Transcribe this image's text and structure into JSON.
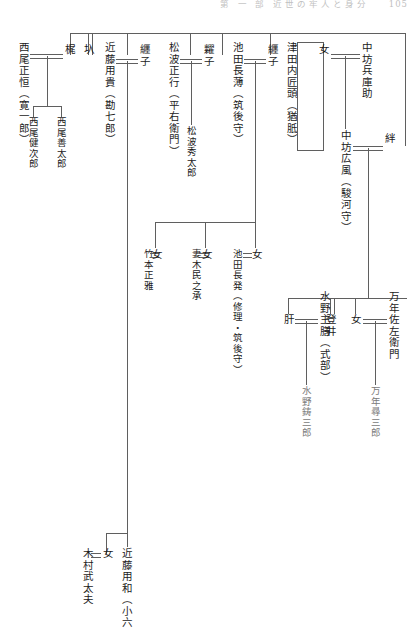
{
  "header": {
    "running_head": "第 一 部  近世の牢人と身分",
    "page_number": "105"
  },
  "chart": {
    "kind": "genealogy-tree",
    "orientation": "vertical-japanese",
    "people": {
      "nishio_masatsune": "西尾正恒（寛一郎）",
      "kaji": "梶",
      "iri": "圦",
      "nishio_kenjiro": "西尾健次郎",
      "nishio_zentaro": "西尾善太郎",
      "kondo_mochitaka": "近藤用貴（勘七郎）",
      "ito_ko_1": "纒子",
      "matsunami_masayuki": "松波正行（平右衛門）",
      "ito_ko_2": "糶子",
      "matsunami_hidetaro": "松波秀太郎",
      "ikeda_nagausu": "池田長薄（筑後守）",
      "ito_ko_3": "纒子",
      "tsuda_takumi_no_kami": "津田内匠頭（猶胝）",
      "onna_a": "女",
      "nakabo_hyogonosuke": "中坊兵庫助",
      "nakabo_hirokaze": "中坊広風（駿河守）",
      "kizuna": "絆",
      "takemoto_masamasa": "竹本正雅",
      "onna_b": "女",
      "tsumaki_tamiosuke": "妻木民之承",
      "onna_c": "女",
      "ikeda_nagaoki": "池田長発（修理・筑後守）",
      "onna_d": "女",
      "kimo": "肝",
      "mizuno_shuzen": "水野主膳（式部）",
      "toi": "登井",
      "onna_e": "女",
      "mannen_sazaemon": "万年佐左衛門",
      "mizuno_ryuzaburo": "水野鋳三郎",
      "mannen_jinzaburo": "万年尋三郎",
      "kimura_budayu": "木村武太夫",
      "onna_f": "女",
      "kondo_mochikazu": "近藤用和（小六）"
    },
    "unions": [
      {
        "left": "西尾正恒（寛一郎）",
        "right": "梶",
        "children": [
          "西尾健次郎",
          "西尾善太郎"
        ]
      },
      {
        "left": "近藤用貴（勘七郎）",
        "right": "纒子",
        "children": [
          "松波秀太郎"
        ]
      },
      {
        "left": "松波正行（平右衛門）",
        "right": "糶子",
        "children": []
      },
      {
        "left": "池田長薄（筑後守）",
        "right": "纒子",
        "children": [
          "女"
        ]
      },
      {
        "left": "女",
        "right": "中坊兵庫助",
        "children": [
          "中坊広風（駿河守）"
        ]
      },
      {
        "left": "中坊広風（駿河守）",
        "right": "絆",
        "children": [
          "肝",
          "登井",
          "女"
        ]
      },
      {
        "left": "竹本正雅",
        "right": "女",
        "children": []
      },
      {
        "left": "妻木民之承",
        "right": "女",
        "children": []
      },
      {
        "left": "池田長発（修理・筑後守）",
        "right": "女",
        "children": []
      },
      {
        "left": "肝",
        "right": "水野主膳（式部）",
        "children": [
          "水野鋳三郎"
        ]
      },
      {
        "left": "女",
        "right": "万年佐左衛門",
        "children": [
          "万年尋三郎"
        ]
      },
      {
        "left": "木村武太夫",
        "right": "女",
        "children": []
      }
    ],
    "sibling_groups": [
      {
        "label": "top-sibling-bar",
        "members": [
          "梶",
          "圦",
          "近藤用貴（勘七郎）",
          "松波正行（平右衛門）",
          "池田長薄（筑後守）",
          "津田内匠頭（猶胝）",
          "中坊兵庫助"
        ]
      },
      {
        "label": "kondo-children-bar",
        "members": [
          "近藤用和（小六）",
          "女"
        ]
      }
    ],
    "colors": {
      "rule": "#5f5f5f",
      "text": "#1b1b1b",
      "page": "#ffffff",
      "faded_text": "#7a7a7a"
    }
  }
}
